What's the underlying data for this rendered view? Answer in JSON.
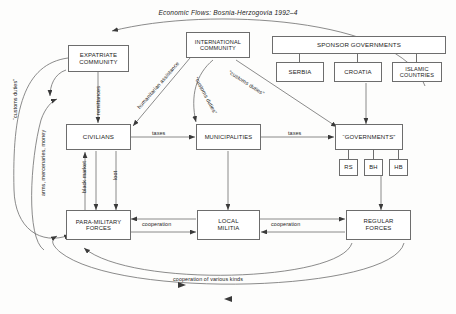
{
  "title": "Economic Flows: Bosnia-Herzogovia 1992–4",
  "nodes": {
    "expatriate": "EXPATRIATE\nCOMMUNITY",
    "international": "INTERNATIONAL\nCOMMUNITY",
    "sponsor": "SPONSOR GOVERNMENTS",
    "serbia": "SERBIA",
    "croatia": "CROATIA",
    "islamic": "ISLAMIC\nCOUNTRIES",
    "civilians": "CIVILIANS",
    "municipalities": "MUNICIPALITIES",
    "governments": "“GOVERNMENTS”",
    "rs": "RS",
    "bh": "BH",
    "hb": "HB",
    "paramilitary": "PARA-MILITARY\nFORCES",
    "militia": "LOCAL\nMILITIA",
    "regular": "REGULAR\nFORCES"
  },
  "edges": {
    "customs_duties_left": "“customs duties”",
    "arms_mercenaries_money": "arms, mercenaries, money",
    "remittances": "remittances",
    "humanitarian_assistance": "humanitarian assistance",
    "customs_duties_municipalities": "“customs duties”",
    "customs_duties_governments": "“customs duties”",
    "taxes_civ_mun": "taxes",
    "taxes_mun_gov": "taxes",
    "black_market": "black market",
    "loot": "loot",
    "cooperation_left": "cooperation",
    "cooperation_right": "cooperation",
    "cooperation_various": "cooperation of various kinds"
  },
  "colors": {
    "stroke": "#6d6d6d",
    "text": "#1b1b1b",
    "background": "#fdfdfc"
  }
}
